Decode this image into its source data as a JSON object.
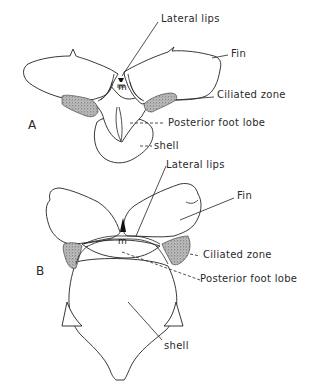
{
  "figure": {
    "panels": [
      {
        "id": "A",
        "label": "A",
        "annotations": {
          "lateral_lips": "Lateral lips",
          "fin": "Fin",
          "ciliated_zone": "Ciliated zone",
          "posterior_foot_lobe": "Posterior foot lobe",
          "shell": "shell"
        },
        "mouth_label": "m"
      },
      {
        "id": "B",
        "label": "B",
        "annotations": {
          "lateral_lips": "Lateral lips",
          "fin": "Fin",
          "ciliated_zone": "Ciliated zone",
          "posterior_foot_lobe": "Posterior foot lobe",
          "shell": "shell"
        },
        "mouth_label": "m"
      }
    ]
  }
}
